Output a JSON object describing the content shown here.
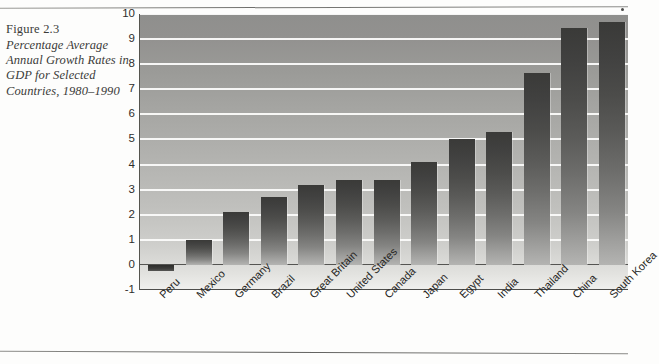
{
  "caption": {
    "figure_number": "Figure 2.3",
    "title": "Percentage Average Annual Growth Rates in GDP for Selected Countries, 1980–1990"
  },
  "chart_data": {
    "type": "bar",
    "xlabel": "",
    "ylabel": "",
    "ylim": [
      -1,
      10
    ],
    "yticks": [
      -1,
      0,
      1,
      2,
      3,
      4,
      5,
      6,
      7,
      8,
      9,
      10
    ],
    "ytick_labels": [
      "-1",
      "0",
      "1",
      "2",
      "3",
      "4",
      "5",
      "6",
      "7",
      "8",
      "9",
      "10"
    ],
    "grid": true,
    "legend": false,
    "categories": [
      "Peru",
      "Mexico",
      "Germany",
      "Brazil",
      "Great Britain",
      "United States",
      "Canada",
      "Japan",
      "Egypt",
      "India",
      "Thailand",
      "China",
      "South Korea"
    ],
    "values": [
      -0.25,
      1.0,
      2.1,
      2.7,
      3.2,
      3.4,
      3.4,
      4.1,
      5.0,
      5.3,
      7.65,
      9.45,
      9.7
    ],
    "colors": {
      "bar_top": "#3a3a38",
      "bar_bottom": "#b4b4b2",
      "plot_background_top": "#8f8f8d",
      "plot_background_bottom": "#f0f0ee",
      "gridline": "#fbfbfa",
      "axis": "#4d4d4b",
      "text": "#2e2e2c"
    }
  }
}
